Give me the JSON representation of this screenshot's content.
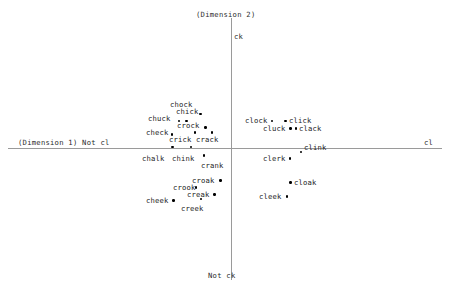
{
  "chart_data": {
    "type": "scatter",
    "title": "",
    "xlabel": "(Dimension 1)",
    "ylabel": "(Dimension 2)",
    "axis_endpoints": {
      "x_left": "Not cl",
      "x_right": "cl",
      "y_top": "ck",
      "y_bottom": "Not ck"
    },
    "grid": false,
    "legend": "none",
    "points": [
      {
        "label": "chock",
        "px": 200.5,
        "py": 114.0,
        "lx": 170,
        "ly": 101,
        "dot": false
      },
      {
        "label": "chick",
        "px": 186.5,
        "py": 121.0,
        "lx": 176,
        "ly": 108,
        "dot": true
      },
      {
        "label": "chuck",
        "px": 179.0,
        "py": 121.0,
        "lx": 148,
        "ly": 115,
        "dot": true
      },
      {
        "label": "crock",
        "px": 205.5,
        "py": 127.5,
        "lx": 177,
        "ly": 122,
        "dot": true
      },
      {
        "label": "check",
        "px": 172.0,
        "py": 134.5,
        "lx": 146,
        "ly": 129,
        "dot": true
      },
      {
        "label": "crick",
        "px": 195.0,
        "py": 132.5,
        "lx": 169,
        "ly": 136,
        "dot": false
      },
      {
        "label": "crack",
        "px": 212.0,
        "py": 132.5,
        "lx": 196,
        "ly": 136,
        "dot": false
      },
      {
        "label": "chalk",
        "px": 172.5,
        "py": 147.0,
        "lx": 142,
        "ly": 155,
        "dot": false
      },
      {
        "label": "chink",
        "px": 191.0,
        "py": 147.0,
        "lx": 172,
        "ly": 155,
        "dot": false
      },
      {
        "label": "crank",
        "px": 204.0,
        "py": 155.5,
        "lx": 201,
        "ly": 162,
        "dot": false
      },
      {
        "label": "croak",
        "px": 220.5,
        "py": 180.5,
        "lx": 192,
        "ly": 177,
        "dot": true
      },
      {
        "label": "crook",
        "px": 196.0,
        "py": 187.5,
        "lx": 173,
        "ly": 184,
        "dot": true
      },
      {
        "label": "creak",
        "px": 214.5,
        "py": 194.5,
        "lx": 187,
        "ly": 191,
        "dot": true
      },
      {
        "label": "cheek",
        "px": 173.5,
        "py": 200.5,
        "lx": 146,
        "ly": 197,
        "dot": true
      },
      {
        "label": "creek",
        "px": 201.0,
        "py": 199.0,
        "lx": 181,
        "ly": 205,
        "dot": false
      },
      {
        "label": "clock",
        "px": 272.0,
        "py": 121.0,
        "lx": 245,
        "ly": 117,
        "dot": true
      },
      {
        "label": "click",
        "px": 285.5,
        "py": 121.0,
        "lx": 289,
        "ly": 117,
        "dot": true
      },
      {
        "label": "cluck",
        "px": 290.5,
        "py": 128.5,
        "lx": 263,
        "ly": 125,
        "dot": true
      },
      {
        "label": "clack",
        "px": 296.0,
        "py": 128.5,
        "lx": 299,
        "ly": 125,
        "dot": true
      },
      {
        "label": "clink",
        "px": 301.0,
        "py": 152.0,
        "lx": 304,
        "ly": 144,
        "dot": true
      },
      {
        "label": "clerk",
        "px": 290.0,
        "py": 158.5,
        "lx": 263,
        "ly": 155,
        "dot": true
      },
      {
        "label": "cloak",
        "px": 290.5,
        "py": 182.5,
        "lx": 294,
        "ly": 179,
        "dot": true
      },
      {
        "label": "cleek",
        "px": 287.0,
        "py": 196.5,
        "lx": 259,
        "ly": 193,
        "dot": true
      }
    ]
  },
  "axes": {
    "x_label_left": "(Dimension 1) Not cl",
    "x_label_right": "cl",
    "y_label_top": "(Dimension 2)",
    "y_tick_top": "ck",
    "y_label_bottom": "Not ck"
  }
}
